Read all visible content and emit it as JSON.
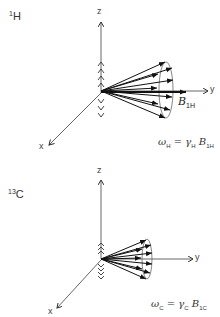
{
  "panels": [
    {
      "nucleus": {
        "mass": "1",
        "symbol": "H"
      },
      "axes": {
        "x": "x",
        "y": "y",
        "z": "z"
      },
      "field": {
        "symbol": "B",
        "subscript": "1H"
      },
      "equation": {
        "omega": "ω",
        "omega_sub": "H",
        "equals": " = ",
        "gamma": "γ",
        "gamma_sub": "H",
        "B": "B",
        "B_sub": "1H"
      }
    },
    {
      "nucleus": {
        "mass": "13",
        "symbol": "C"
      },
      "axes": {
        "x": "x",
        "y": "y",
        "z": "z"
      },
      "equation": {
        "omega": "ω",
        "omega_sub": "C",
        "equals": " = ",
        "gamma": "γ",
        "gamma_sub": "C",
        "B": "B",
        "B_sub": "1C"
      }
    }
  ]
}
